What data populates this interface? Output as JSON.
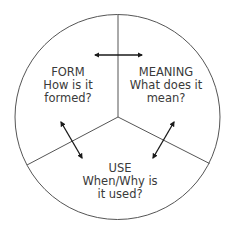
{
  "diagram": {
    "type": "three-segment circle",
    "segments": [
      {
        "id": "form",
        "title": "FORM",
        "line1": "How is it",
        "line2": "formed?"
      },
      {
        "id": "meaning",
        "title": "MEANING",
        "line1": "What does it",
        "line2": "mean?"
      },
      {
        "id": "use",
        "title": "USE",
        "line1": "When/Why is",
        "line2": "it used?"
      }
    ],
    "arrows": [
      {
        "between": [
          "form",
          "meaning"
        ],
        "style": "double-headed"
      },
      {
        "between": [
          "form",
          "use"
        ],
        "style": "double-headed"
      },
      {
        "between": [
          "meaning",
          "use"
        ],
        "style": "double-headed"
      }
    ],
    "colors": {
      "outline": "#555555",
      "arrow": "#1a1a1a",
      "text": "#3a3a3a",
      "background": "#ffffff"
    }
  }
}
